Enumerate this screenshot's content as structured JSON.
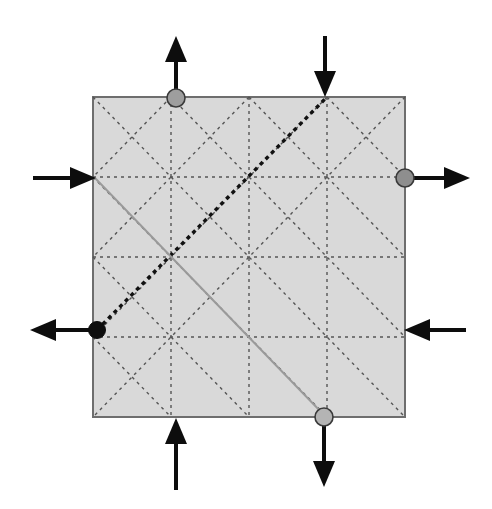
{
  "figure": {
    "canvas": {
      "width": 492,
      "height": 509
    },
    "background_color": "#ffffff"
  },
  "square": {
    "name": "shaded-square",
    "x": 93,
    "y": 97,
    "width": 312,
    "height": 320,
    "fill_color": "#d9d9d9",
    "stroke_color": "#6e6e6e",
    "stroke_width": 2
  },
  "grid": {
    "divisions": 4,
    "cell_w": 78,
    "cell_h": 80,
    "dash_color": "#555555",
    "dash_pattern": "3 4",
    "dash_width": 1.4
  },
  "highlight_lines": [
    {
      "name": "bold-dashed-diagonal",
      "x1": 97,
      "y1": 330,
      "x2": 325,
      "y2": 99,
      "color": "#111111",
      "width": 3.4,
      "dash": "4 4",
      "style": "bold-dashed"
    },
    {
      "name": "light-solid-diagonal",
      "x1": 95,
      "y1": 178,
      "x2": 324,
      "y2": 415,
      "color": "#9a9a9a",
      "width": 2,
      "dash": "none",
      "style": "solid"
    }
  ],
  "nodes": [
    {
      "name": "node-top-grey",
      "cx": 176,
      "cy": 98,
      "r": 9,
      "fill": "#9e9e9e",
      "stroke": "#3a3a3a",
      "kind": "grey"
    },
    {
      "name": "node-right-grey",
      "cx": 405,
      "cy": 178,
      "r": 9,
      "fill": "#8e8e8e",
      "stroke": "#3a3a3a",
      "kind": "grey"
    },
    {
      "name": "node-left-black",
      "cx": 97,
      "cy": 330,
      "r": 8.5,
      "fill": "#0d0d0d",
      "stroke": "#0d0d0d",
      "kind": "black"
    },
    {
      "name": "node-bottom-grey",
      "cx": 324,
      "cy": 417,
      "r": 9,
      "fill": "#b4b4b4",
      "stroke": "#3a3a3a",
      "kind": "grey"
    }
  ],
  "arrows": [
    {
      "name": "arrow-top-left-out",
      "direction": "up",
      "tail_x": 176,
      "tail_y": 96,
      "head_x": 176,
      "head_y": 36,
      "color": "#0d0d0d",
      "shaft_width": 4,
      "head_len": 26,
      "head_w": 22,
      "flow": "outward"
    },
    {
      "name": "arrow-top-right-in",
      "direction": "down",
      "tail_x": 325,
      "tail_y": 36,
      "head_x": 325,
      "head_y": 97,
      "color": "#0d0d0d",
      "shaft_width": 4,
      "head_len": 26,
      "head_w": 22,
      "flow": "inward"
    },
    {
      "name": "arrow-left-upper-in",
      "direction": "right",
      "tail_x": 33,
      "tail_y": 178,
      "head_x": 96,
      "head_y": 178,
      "color": "#0d0d0d",
      "shaft_width": 4,
      "head_len": 26,
      "head_w": 22,
      "flow": "inward"
    },
    {
      "name": "arrow-right-upper-out",
      "direction": "right",
      "tail_x": 410,
      "tail_y": 178,
      "head_x": 470,
      "head_y": 178,
      "color": "#0d0d0d",
      "shaft_width": 4,
      "head_len": 26,
      "head_w": 22,
      "flow": "outward"
    },
    {
      "name": "arrow-left-lower-out",
      "direction": "left",
      "tail_x": 94,
      "tail_y": 330,
      "head_x": 30,
      "head_y": 330,
      "color": "#0d0d0d",
      "shaft_width": 4,
      "head_len": 26,
      "head_w": 22,
      "flow": "outward"
    },
    {
      "name": "arrow-right-lower-in",
      "direction": "left",
      "tail_x": 466,
      "tail_y": 330,
      "head_x": 404,
      "head_y": 330,
      "color": "#0d0d0d",
      "shaft_width": 4,
      "head_len": 26,
      "head_w": 22,
      "flow": "inward"
    },
    {
      "name": "arrow-bottom-left-in",
      "direction": "up",
      "tail_x": 176,
      "tail_y": 490,
      "head_x": 176,
      "head_y": 418,
      "color": "#0d0d0d",
      "shaft_width": 4,
      "head_len": 26,
      "head_w": 22,
      "flow": "inward"
    },
    {
      "name": "arrow-bottom-right-out",
      "direction": "down",
      "tail_x": 324,
      "tail_y": 424,
      "head_x": 324,
      "head_y": 487,
      "color": "#0d0d0d",
      "shaft_width": 4,
      "head_len": 26,
      "head_w": 22,
      "flow": "outward"
    }
  ]
}
